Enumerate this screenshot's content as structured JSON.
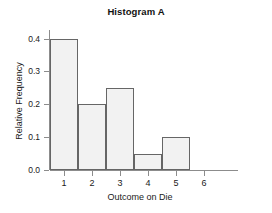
{
  "chart_data": {
    "type": "bar",
    "title": "Histogram A",
    "xlabel": "Outcome on Die",
    "ylabel": "Relative Frequency",
    "categories": [
      "1",
      "2",
      "3",
      "4",
      "5",
      "6"
    ],
    "values": [
      0.4,
      0.2,
      0.25,
      0.05,
      0.1,
      0.0
    ],
    "xtick_labels": [
      "1",
      "2",
      "3",
      "4",
      "5",
      "6"
    ],
    "ytick_labels": [
      "0.0",
      "0.1",
      "0.2",
      "0.3",
      "0.4"
    ],
    "ytick_values": [
      0.0,
      0.1,
      0.2,
      0.3,
      0.4
    ],
    "ylim": [
      0.0,
      0.42
    ],
    "xlim": [
      0.5,
      6.5
    ],
    "grid": false,
    "legend": false,
    "bar_fill_color": "#f2f2f2",
    "bar_edge_color": "#666666",
    "axis_color": "#8c8c8c",
    "background_color": "#ffffff"
  }
}
